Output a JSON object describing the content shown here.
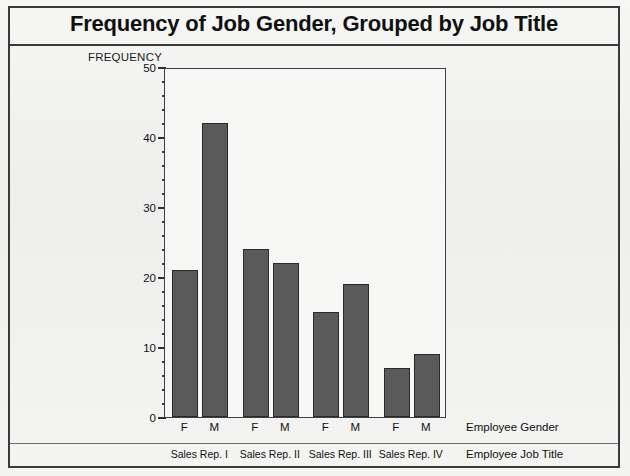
{
  "figure": {
    "title": "Frequency of Job Gender, Grouped by Job Title",
    "y_axis_title": "FREQUENCY",
    "x_axis_name_primary": "Employee Gender",
    "x_axis_name_secondary": "Employee Job Title",
    "frame_color": "#3f3f46",
    "bar_fill_color": "#5a5a5a",
    "bar_edge_color": "#2a2a2a",
    "background_color": "#f2f2f0"
  },
  "chart_data": {
    "type": "bar",
    "title": "Frequency of Job Gender, Grouped by Job Title",
    "xlabel": "Employee Gender",
    "xlabel_secondary": "Employee Job Title",
    "ylabel": "FREQUENCY",
    "ylim": [
      0,
      50
    ],
    "yticks": [
      0,
      10,
      20,
      30,
      40,
      50
    ],
    "ytick_labels": [
      "0",
      "10",
      "20",
      "30",
      "40",
      "50"
    ],
    "minor_tick_step": 2,
    "grid": false,
    "legend": false,
    "grouped": true,
    "categories": [
      "Sales Rep. I",
      "Sales Rep. II",
      "Sales Rep. III",
      "Sales Rep. IV"
    ],
    "subcategories": [
      "F",
      "M"
    ],
    "series": [
      {
        "name": "F",
        "values": [
          21,
          24,
          15,
          7
        ]
      },
      {
        "name": "M",
        "values": [
          42,
          22,
          19,
          9
        ]
      }
    ],
    "bars": [
      {
        "group": "Sales Rep. I",
        "gender": "F",
        "value": 21
      },
      {
        "group": "Sales Rep. I",
        "gender": "M",
        "value": 42
      },
      {
        "group": "Sales Rep. II",
        "gender": "F",
        "value": 24
      },
      {
        "group": "Sales Rep. II",
        "gender": "M",
        "value": 22
      },
      {
        "group": "Sales Rep. III",
        "gender": "F",
        "value": 15
      },
      {
        "group": "Sales Rep. III",
        "gender": "M",
        "value": 19
      },
      {
        "group": "Sales Rep. IV",
        "gender": "F",
        "value": 7
      },
      {
        "group": "Sales Rep. IV",
        "gender": "M",
        "value": 9
      }
    ]
  }
}
